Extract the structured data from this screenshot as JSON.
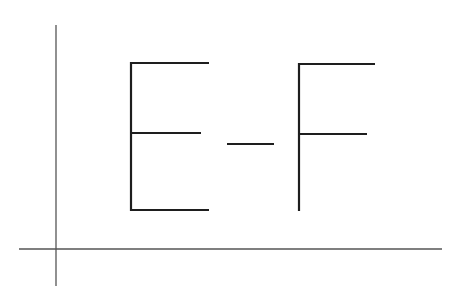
{
  "diagram": {
    "text": "E-F",
    "characters": [
      "E",
      "-",
      "F"
    ],
    "axes": {
      "vertical": true,
      "horizontal": true
    },
    "colors": {
      "background": "#ffffff",
      "axis": "#555555",
      "glyph": "#1e1e1e"
    }
  }
}
